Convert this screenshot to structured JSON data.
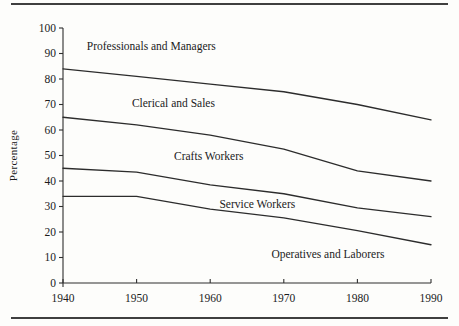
{
  "colors": {
    "line": "#2c2c2c",
    "axis": "#2f2f2f",
    "text": "#1b1b1b",
    "rule": "#3f3f3f",
    "background": "#fdfdfb"
  },
  "chart_data": {
    "type": "line",
    "title": "",
    "xlabel": "",
    "ylabel": "Percentage",
    "xlim": [
      1940,
      1990
    ],
    "ylim": [
      0,
      100
    ],
    "grid": false,
    "legend_position": "none (labels placed inside plot regions)",
    "x_ticks": [
      "1940",
      "1950",
      "1960",
      "1970",
      "1980",
      "1990"
    ],
    "y_ticks": [
      "0",
      "10",
      "20",
      "30",
      "40",
      "50",
      "60",
      "70",
      "80",
      "90",
      "100"
    ],
    "x": [
      1940,
      1950,
      1960,
      1970,
      1980,
      1990
    ],
    "series": [
      {
        "name": "Boundary: Professionals and Managers / Clerical and Sales",
        "values": [
          84,
          81,
          78,
          75,
          70,
          64
        ]
      },
      {
        "name": "Boundary: Clerical and Sales / Crafts Workers",
        "values": [
          65,
          62,
          58,
          52.5,
          44,
          40
        ]
      },
      {
        "name": "Boundary: Crafts Workers / Service Workers",
        "values": [
          45,
          43.5,
          38.5,
          35,
          29.5,
          26
        ]
      },
      {
        "name": "Boundary: Service Workers / Operatives and Laborers",
        "values": [
          34,
          34,
          29,
          25.5,
          20.5,
          15
        ]
      }
    ],
    "region_labels": [
      {
        "text": "Professionals and Managers",
        "x": 1952,
        "y": 93
      },
      {
        "text": "Clerical and Sales",
        "x": 1955,
        "y": 70.5
      },
      {
        "text": "Crafts Workers",
        "x": 1959.8,
        "y": 50
      },
      {
        "text": "Service Workers",
        "x": 1966.4,
        "y": 31
      },
      {
        "text": "Operatives and Laborers",
        "x": 1976,
        "y": 11.5
      }
    ]
  }
}
